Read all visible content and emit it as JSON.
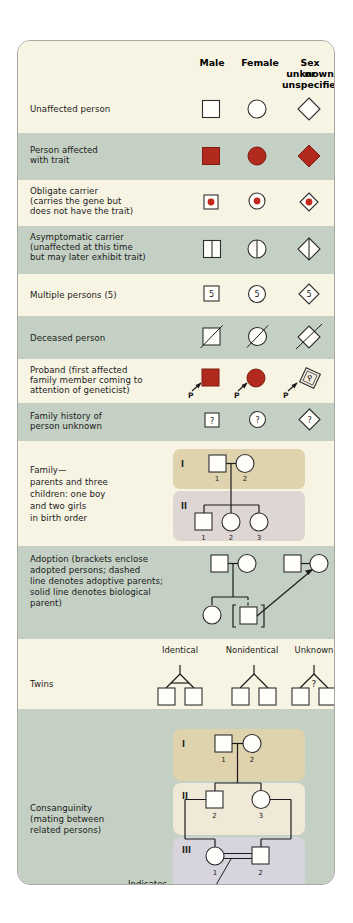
{
  "card": {
    "background": "#f7f4e8",
    "border_color": "#a8a8a0"
  },
  "colors": {
    "band_cream": "#f7f4e4",
    "band_sage": "#c3d0c3",
    "affected_red": "#b22a1d",
    "carrier_dot": "#c0291b",
    "panel_khaki": "#ded3ac",
    "panel_cream": "#f0e9d8",
    "panel_mauve": "#d8d4dd",
    "panel_pinkgrey": "#ded6d2",
    "symbol_fill": "#fffefb",
    "line": "#1b1b1b"
  },
  "header": {
    "male": "Male",
    "female": "Female",
    "unknown_line1": "Sex unknown",
    "unknown_line2": "or unspecified"
  },
  "rows": [
    {
      "id": "unaffected",
      "label": "Unaffected person",
      "band": "cream"
    },
    {
      "id": "affected",
      "label_lines": [
        "Person affected",
        "with trait"
      ],
      "band": "sage"
    },
    {
      "id": "obligate-carrier",
      "label_lines": [
        "Obligate carrier",
        "(carries the gene but",
        "does not have the trait)"
      ],
      "band": "cream"
    },
    {
      "id": "asymptomatic-carrier",
      "label_lines": [
        "Asymptomatic carrier",
        "(unaffected at this time",
        "but may later exhibit trait)"
      ],
      "band": "sage"
    },
    {
      "id": "multiple-persons",
      "label": "Multiple persons (5)",
      "count": "5",
      "band": "cream"
    },
    {
      "id": "deceased",
      "label": "Deceased person",
      "band": "sage"
    },
    {
      "id": "proband",
      "label_lines": [
        "Proband (first affected",
        "family member coming to",
        "attention of geneticist)"
      ],
      "marker": "P",
      "band": "cream"
    },
    {
      "id": "family-history-unknown",
      "label_lines": [
        "Family history of",
        "person unknown"
      ],
      "marker": "?",
      "band": "sage"
    },
    {
      "id": "family",
      "label_lines": [
        "Family—",
        "parents and three",
        "children: one boy",
        "and two girls",
        "in birth order"
      ],
      "band": "cream"
    },
    {
      "id": "adoption",
      "label_lines": [
        "Adoption (brackets enclose",
        "adopted persons; dashed",
        "line denotes adoptive parents;",
        "solid line denotes biological",
        "parent)"
      ],
      "band": "sage"
    },
    {
      "id": "twins",
      "label": "Twins",
      "band": "cream"
    },
    {
      "id": "consanguinity",
      "label_lines": [
        "Consanguinity",
        "(mating between",
        "related persons)"
      ],
      "band": "sage"
    }
  ],
  "family_pedigree": {
    "generations": [
      "I",
      "II"
    ],
    "gen1_ids": [
      "1",
      "2"
    ],
    "gen2_ids": [
      "1",
      "2",
      "3"
    ]
  },
  "twins": {
    "identical": "Identical",
    "nonidentical": "Nonidentical",
    "unknown": "Unknown",
    "unknown_marker": "?"
  },
  "consanguinity_pedigree": {
    "generations": [
      "I",
      "II",
      "III"
    ],
    "gen1_ids": [
      "1",
      "2"
    ],
    "gen2_ids": [
      "2",
      "3"
    ],
    "gen3_ids": [
      "1",
      "2"
    ]
  },
  "callout": {
    "line1": "Indicates",
    "line2": "consanguinity"
  }
}
